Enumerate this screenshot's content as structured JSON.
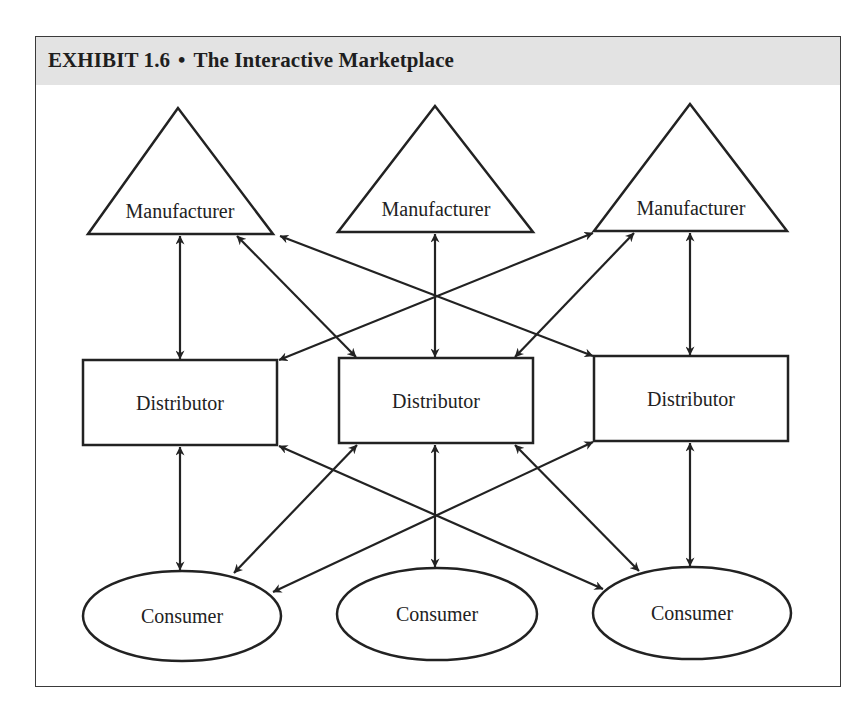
{
  "header": {
    "exhibit": "EXHIBIT 1.6",
    "separator": "•",
    "title": "The Interactive Marketplace"
  },
  "diagram": {
    "levels": [
      "Manufacturer",
      "Distributor",
      "Consumer"
    ],
    "nodes": {
      "manufacturers": [
        {
          "label": "Manufacturer",
          "shape": "triangle"
        },
        {
          "label": "Manufacturer",
          "shape": "triangle"
        },
        {
          "label": "Manufacturer",
          "shape": "triangle"
        }
      ],
      "distributors": [
        {
          "label": "Distributor",
          "shape": "rectangle"
        },
        {
          "label": "Distributor",
          "shape": "rectangle"
        },
        {
          "label": "Distributor",
          "shape": "rectangle"
        }
      ],
      "consumers": [
        {
          "label": "Consumer",
          "shape": "ellipse"
        },
        {
          "label": "Consumer",
          "shape": "ellipse"
        },
        {
          "label": "Consumer",
          "shape": "ellipse"
        }
      ]
    },
    "edges": [
      {
        "from": "Manufacturer 1",
        "to": "Distributor 1",
        "type": "bidirectional"
      },
      {
        "from": "Manufacturer 1",
        "to": "Distributor 2",
        "type": "bidirectional"
      },
      {
        "from": "Manufacturer 1",
        "to": "Distributor 3",
        "type": "bidirectional"
      },
      {
        "from": "Manufacturer 2",
        "to": "Distributor 2",
        "type": "bidirectional"
      },
      {
        "from": "Manufacturer 3",
        "to": "Distributor 1",
        "type": "bidirectional"
      },
      {
        "from": "Manufacturer 3",
        "to": "Distributor 2",
        "type": "bidirectional"
      },
      {
        "from": "Manufacturer 3",
        "to": "Distributor 3",
        "type": "bidirectional"
      },
      {
        "from": "Distributor 1",
        "to": "Consumer 1",
        "type": "bidirectional"
      },
      {
        "from": "Distributor 1",
        "to": "Consumer 3",
        "type": "bidirectional"
      },
      {
        "from": "Distributor 2",
        "to": "Consumer 1",
        "type": "bidirectional"
      },
      {
        "from": "Distributor 2",
        "to": "Consumer 2",
        "type": "bidirectional"
      },
      {
        "from": "Distributor 2",
        "to": "Consumer 3",
        "type": "bidirectional"
      },
      {
        "from": "Distributor 3",
        "to": "Consumer 1",
        "type": "bidirectional"
      },
      {
        "from": "Distributor 3",
        "to": "Consumer 3",
        "type": "bidirectional"
      }
    ]
  },
  "colors": {
    "header_band": "#e3e3e3",
    "stroke": "#222222",
    "text": "#1e1e1e"
  }
}
